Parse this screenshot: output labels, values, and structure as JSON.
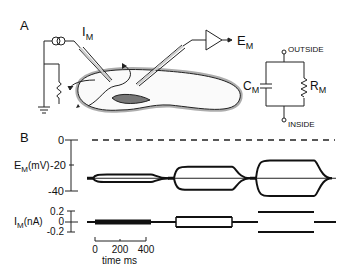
{
  "panel_a": {
    "label": "A",
    "current_label": "I",
    "current_sub": "M",
    "voltage_label": "E",
    "voltage_sub": "M",
    "circuit": {
      "outside_label": "OUTSIDE",
      "inside_label": "INSIDE",
      "capacitor_label": "C",
      "capacitor_sub": "M",
      "resistor_label": "R",
      "resistor_sub": "M"
    }
  },
  "panel_b": {
    "label": "B",
    "em_axis": {
      "label": "E",
      "label_sub": "M",
      "label_unit": "(mV)",
      "ticks": [
        "0",
        "-20",
        "-40"
      ]
    },
    "im_axis": {
      "label": "I",
      "label_sub": "M",
      "label_unit": "(nA)",
      "ticks": [
        "0.2",
        "0",
        "-0.2"
      ]
    },
    "time_scale": {
      "ticks": [
        "0",
        "200",
        "400"
      ],
      "label": "time  ms"
    }
  },
  "chart_data": {
    "type": "line",
    "title": "",
    "xlabel": "time ms",
    "series": [
      {
        "name": "E_M (mV) response 1",
        "baseline": -30,
        "amplitude": 3,
        "current_nA": 0.05
      },
      {
        "name": "E_M (mV) response 2",
        "baseline": -30,
        "amplitude": 9,
        "current_nA": 0.1
      },
      {
        "name": "E_M (mV) response 3",
        "baseline": -30,
        "amplitude": 14,
        "current_nA": 0.2
      }
    ],
    "em_ylim": [
      -40,
      0
    ],
    "im_ylim": [
      -0.2,
      0.2
    ],
    "x_scale_ms": [
      0,
      400
    ]
  }
}
